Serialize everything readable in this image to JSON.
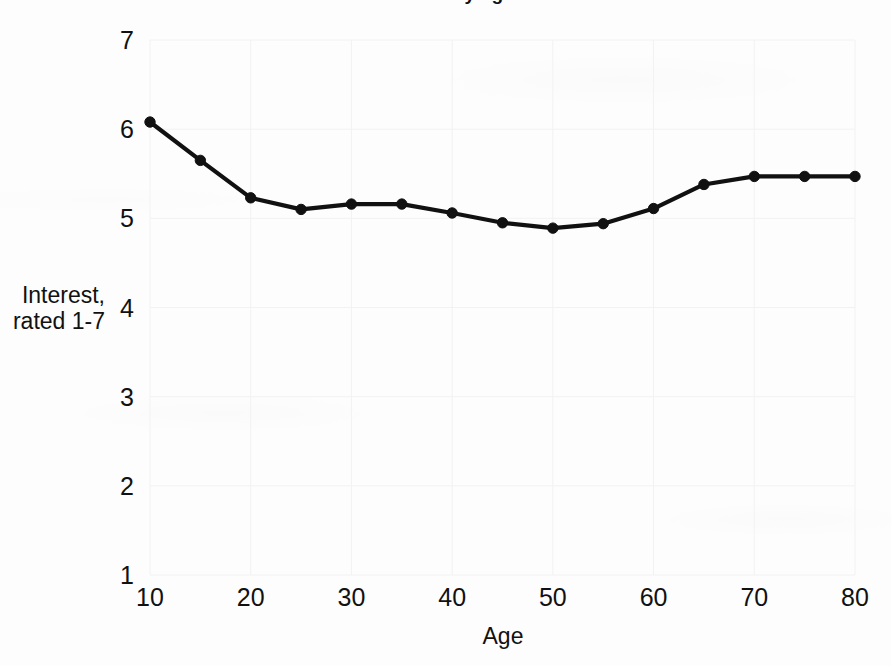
{
  "figure": {
    "clipped_title_fragment": "Interest by age",
    "background_color": "#fdfdfd",
    "ink_color": "#111111",
    "gridline_color": "#f2f2f2"
  },
  "axes": {
    "y_label_line1": "Interest,",
    "y_label_line2": "rated 1-7",
    "x_label": "Age",
    "y_ticks": [
      "7",
      "6",
      "5",
      "4",
      "3",
      "2",
      "1"
    ],
    "x_ticks": [
      "10",
      "20",
      "30",
      "40",
      "50",
      "60",
      "70",
      "80"
    ]
  },
  "chart_data": {
    "type": "line",
    "title": "Interest by age",
    "xlabel": "Age",
    "ylabel": "Interest, rated 1-7",
    "xlim": [
      10,
      80
    ],
    "ylim": [
      1,
      7
    ],
    "xticks": [
      10,
      20,
      30,
      40,
      50,
      60,
      70,
      80
    ],
    "yticks": [
      1,
      2,
      3,
      4,
      5,
      6,
      7
    ],
    "grid": true,
    "legend": null,
    "marker": "filled-circle",
    "x": [
      10,
      15,
      20,
      25,
      30,
      35,
      40,
      45,
      50,
      55,
      60,
      65,
      70,
      75,
      80
    ],
    "values": [
      6.08,
      5.65,
      5.23,
      5.1,
      5.16,
      5.16,
      5.06,
      4.95,
      4.89,
      4.94,
      5.11,
      5.38,
      5.47,
      5.47,
      5.47
    ],
    "series": [
      {
        "name": "Interest",
        "values": [
          6.08,
          5.65,
          5.23,
          5.1,
          5.16,
          5.16,
          5.06,
          4.95,
          4.89,
          4.94,
          5.11,
          5.38,
          5.47,
          5.47,
          5.47
        ]
      }
    ]
  }
}
